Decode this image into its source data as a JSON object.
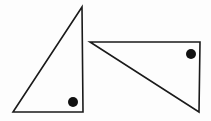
{
  "diagram": {
    "background": "#fdfdfd",
    "stroke_color": "#1a1a1a",
    "dot_color": "#111111",
    "triangles": [
      {
        "name": "left-right-triangle",
        "points": "82,7 13,112 83,112",
        "right_angle_marker": {
          "cx": 73,
          "cy": 102,
          "r": 5
        }
      },
      {
        "name": "right-right-triangle",
        "points": "90,42 200,42 199,112",
        "right_angle_marker": {
          "cx": 191,
          "cy": 54,
          "r": 5
        }
      }
    ]
  }
}
